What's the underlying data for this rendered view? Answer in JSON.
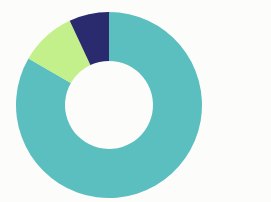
{
  "chart_data": {
    "type": "pie",
    "variant": "donut",
    "title": "",
    "subtitle": "",
    "xlabel": "",
    "ylabel": "",
    "grid": false,
    "legend": false,
    "legend_position": "none",
    "labels": [
      "Segment 1",
      "Segment 2",
      "Segment 3"
    ],
    "values": [
      83.3,
      9.7,
      7.0
    ],
    "units": "percent",
    "total": 100,
    "start_angle_deg": 0,
    "direction": "clockwise",
    "slices": [
      {
        "name": "Segment 1",
        "value": 83.3,
        "color": "#5bbfc0",
        "start_angle_deg": 0,
        "end_angle_deg": 300
      },
      {
        "name": "Segment 2",
        "value": 9.7,
        "color": "#c3f08a",
        "start_angle_deg": 300,
        "end_angle_deg": 335
      },
      {
        "name": "Segment 3",
        "value": 7.0,
        "color": "#2a2a6e",
        "start_angle_deg": 335,
        "end_angle_deg": 360
      }
    ],
    "geometry": {
      "center_x": 109,
      "center_y": 105,
      "outer_radius": 93,
      "inner_radius": 44
    },
    "background_color": "#fcfcfa"
  }
}
